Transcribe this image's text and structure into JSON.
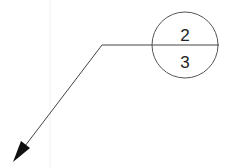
{
  "balloon": {
    "top_value": "2",
    "bottom_value": "3"
  },
  "colors": {
    "line": "#333333",
    "background": "#ffffff",
    "faint_guide": "#f2f2f2"
  }
}
